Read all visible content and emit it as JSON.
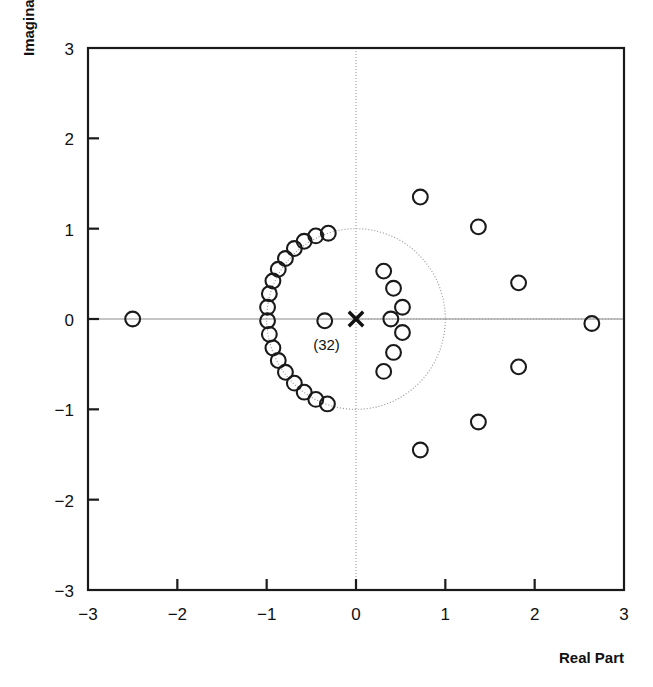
{
  "chart_data": {
    "type": "scatter",
    "title": "",
    "xlabel": "Real Part",
    "ylabel": "Imaginary Part",
    "xlim": [
      -3,
      3
    ],
    "ylim": [
      -3,
      3
    ],
    "xticks": [
      -3,
      -2,
      -1,
      0,
      1,
      2,
      3
    ],
    "yticks": [
      -3,
      -2,
      -1,
      0,
      1,
      2,
      3
    ],
    "xtick_labels": [
      "-3",
      "-2",
      "-1",
      "0",
      "1",
      "2",
      "3"
    ],
    "ytick_labels": [
      "-3",
      "-2",
      "-1",
      "0",
      "1",
      "2",
      "3"
    ],
    "grid": false,
    "legend": "none",
    "annotations": [
      {
        "text": "(32)",
        "x": -0.33,
        "y": -0.28,
        "note": "multiplicity label for pole at origin"
      }
    ],
    "reference_shapes": [
      {
        "kind": "unit-circle",
        "cx": 0,
        "cy": 0,
        "r": 1,
        "style": "dotted"
      },
      {
        "kind": "axis-line",
        "orientation": "horizontal",
        "at": 0,
        "style": "solid-gray"
      },
      {
        "kind": "axis-line",
        "orientation": "vertical",
        "at": 0,
        "style": "dotted-gray"
      }
    ],
    "series": [
      {
        "name": "zeros",
        "marker": "open-circle",
        "points": [
          [
            -2.5,
            0.0
          ],
          [
            -0.35,
            -0.02
          ],
          [
            2.64,
            -0.05
          ],
          [
            -0.31,
            0.95
          ],
          [
            -0.45,
            0.92
          ],
          [
            -0.58,
            0.86
          ],
          [
            -0.69,
            0.78
          ],
          [
            -0.79,
            0.67
          ],
          [
            -0.87,
            0.55
          ],
          [
            -0.93,
            0.42
          ],
          [
            -0.97,
            0.28
          ],
          [
            -0.99,
            0.13
          ],
          [
            -0.99,
            -0.02
          ],
          [
            -0.97,
            -0.17
          ],
          [
            -0.93,
            -0.32
          ],
          [
            -0.87,
            -0.46
          ],
          [
            -0.79,
            -0.59
          ],
          [
            -0.69,
            -0.71
          ],
          [
            -0.58,
            -0.81
          ],
          [
            -0.45,
            -0.89
          ],
          [
            -0.32,
            -0.94
          ],
          [
            0.31,
            0.53
          ],
          [
            0.42,
            0.34
          ],
          [
            0.52,
            0.13
          ],
          [
            0.39,
            0.0
          ],
          [
            0.52,
            -0.15
          ],
          [
            0.42,
            -0.37
          ],
          [
            0.31,
            -0.58
          ],
          [
            0.72,
            1.35
          ],
          [
            1.37,
            1.02
          ],
          [
            1.82,
            0.4
          ],
          [
            1.82,
            -0.53
          ],
          [
            1.37,
            -1.14
          ],
          [
            0.72,
            -1.45
          ]
        ]
      },
      {
        "name": "poles",
        "marker": "x",
        "multiplicity_label": "(32)",
        "points": [
          [
            0.0,
            0.0
          ]
        ]
      }
    ]
  },
  "colors": {
    "marker_stroke": "#1a1a1a",
    "frame": "#1a1a1a",
    "reference_line": "#9a9a9a",
    "background": "#ffffff"
  }
}
